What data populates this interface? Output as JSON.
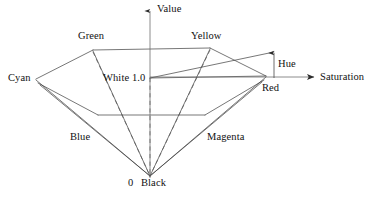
{
  "figure": {
    "background_color": "#ffffff",
    "line_color": "#3c3c3c",
    "text_color": "#111111"
  },
  "axes": {
    "vertical": {
      "label": "Value",
      "arrow": "up-arrow-icon",
      "x": 150,
      "top_y": 9,
      "bottom_y": 178
    },
    "horizontal": {
      "label": "Saturation",
      "arrow": "right-arrow-icon",
      "y": 77,
      "left_x": 150,
      "right_x": 318
    }
  },
  "annotations": {
    "hue": {
      "label": "Hue",
      "arrow": "up-arrow-icon",
      "x": 274,
      "from_y": 77,
      "to_y": 50
    },
    "white": {
      "label": "White 1.0",
      "x": 150,
      "y": 78
    },
    "origin": {
      "label": "0",
      "x": 150,
      "y": 176
    },
    "black": {
      "label": "Black"
    }
  },
  "vertices": [
    {
      "name": "green",
      "label": "Green",
      "x": 93,
      "y": 50,
      "label_x": 78,
      "label_y": 31
    },
    {
      "name": "yellow",
      "label": "Yellow",
      "x": 210,
      "y": 48,
      "label_x": 192,
      "label_y": 31
    },
    {
      "name": "cyan",
      "label": "Cyan",
      "x": 36,
      "y": 79,
      "label_x": 8,
      "label_y": 73
    },
    {
      "name": "red",
      "label": "Red",
      "x": 266,
      "y": 76,
      "label_x": 262,
      "label_y": 80
    },
    {
      "name": "blue",
      "label": "Blue",
      "x": 36,
      "y": 84,
      "label_x": 70,
      "label_y": 131
    },
    {
      "name": "magenta",
      "label": "Magenta",
      "x": 266,
      "y": 81,
      "label_x": 207,
      "label_y": 131
    },
    {
      "name": "white",
      "label": "White 1.0",
      "x": 150,
      "y": 78,
      "label_x": 104,
      "label_y": 72
    },
    {
      "name": "black",
      "label": "Black",
      "x": 150,
      "y": 176,
      "label_x": 126,
      "label_y": 177
    }
  ],
  "geometry": {
    "solid_edges": [
      {
        "name": "cyan-green",
        "points": "36,79 93,50"
      },
      {
        "name": "green-yellow",
        "points": "93,50 210,48"
      },
      {
        "name": "yellow-red",
        "points": "210,48 266,76"
      },
      {
        "name": "cyan-black-a",
        "points": "36,82 150,176"
      },
      {
        "name": "cyan-black-b",
        "points": "39,84 150,176"
      },
      {
        "name": "red-black-a",
        "points": "266,78 150,176"
      },
      {
        "name": "red-black-b",
        "points": "263,81 150,176"
      },
      {
        "name": "green-black",
        "points": "93,52 150,176"
      },
      {
        "name": "yellow-black",
        "points": "210,50 150,176"
      },
      {
        "name": "mid-horizontal",
        "points": "98,115 205,115"
      },
      {
        "name": "cyan-mid-left",
        "points": "36,82 98,115"
      },
      {
        "name": "red-mid-right",
        "points": "266,78 205,115"
      },
      {
        "name": "white-red",
        "points": "150,78 266,76"
      },
      {
        "name": "white-hue-top",
        "points": "150,78 274,51"
      }
    ],
    "dashed_edges": [
      {
        "name": "green-black-dashed",
        "points": "93,51 150,176"
      },
      {
        "name": "yellow-black-dashed",
        "points": "210,49 150,176"
      },
      {
        "name": "white-black-dashed",
        "points": "150,78 150,176"
      }
    ]
  }
}
